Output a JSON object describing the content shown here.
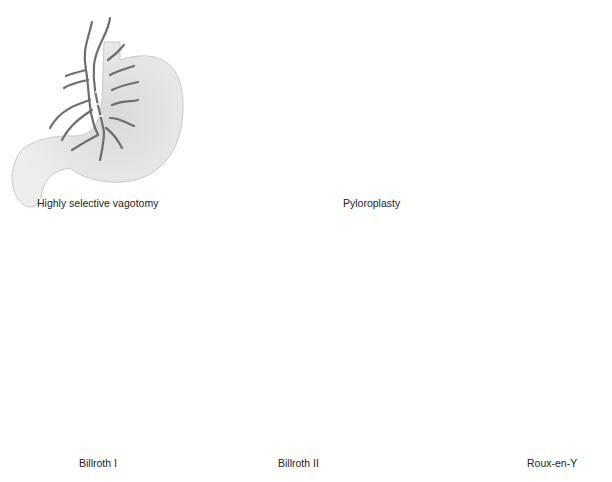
{
  "figure": {
    "panels": [
      {
        "id": "hsv",
        "label": "Highly selective vagotomy"
      },
      {
        "id": "pyloroplasty",
        "label": "Pyloroplasty"
      },
      {
        "id": "pyloroplasty-closed",
        "label": ""
      },
      {
        "id": "billroth-1",
        "label": "Billroth I"
      },
      {
        "id": "billroth-2",
        "label": "Billroth II"
      },
      {
        "id": "roux-en-y",
        "label": "Roux-en-Y"
      }
    ]
  },
  "colors": {
    "organ_fill": "#eeeeee",
    "organ_shade": "#d6d6d6",
    "organ_outline": "#c8c8c8",
    "nerve": "#6e6e6e",
    "suture": "#444444",
    "arrow": "#333333"
  }
}
